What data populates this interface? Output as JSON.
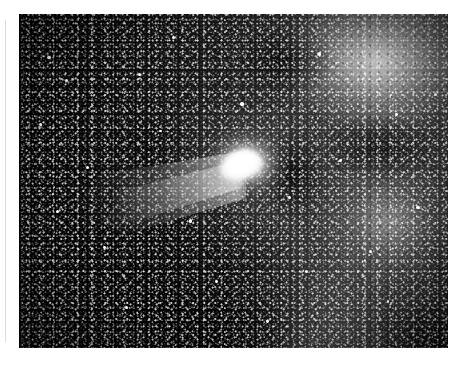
{
  "document": {
    "type": "astronomical-photograph",
    "subject": "comet",
    "medium": "black-and-white film plate",
    "caption": "",
    "background_color": "#ffffff"
  },
  "photo": {
    "name": "comet-photograph",
    "alt_text": "Black and white astronomical photograph of a bright comet with a fan-shaped dust tail set against a dense, grainy star field with diffuse nebulosity",
    "frame": {
      "x": 19,
      "y": 14,
      "width": 429,
      "height": 334
    },
    "palette": {
      "sky_dark": "#000000",
      "sky_mid": "#262626",
      "sky_light": "#3a3a3a",
      "nebulosity": "#d7d7d7",
      "star_white": "#ffffff",
      "comet_core": "#ffffff",
      "margin": "#ffffff",
      "scan_line": "#dcdcdc"
    },
    "features": [
      {
        "name": "comet-nucleus",
        "label": "Comet nucleus and inner coma",
        "position": {
          "x": 222,
          "y": 151
        },
        "brightness": "saturated white",
        "shape": "elongated teardrop"
      },
      {
        "name": "comet-tail",
        "label": "Fan-shaped dust tail",
        "direction": "down and to the left (southwest)",
        "extent_px": 175,
        "brightness": "bright diffuse, fading outward"
      },
      {
        "name": "nebulosity-upper-right",
        "label": "Diffuse bright nebulosity, upper right",
        "position": {
          "x": 380,
          "y": 55
        },
        "brightness": "bright mottled gray"
      },
      {
        "name": "nebulosity-lower-right",
        "label": "Rounded brighter patch, lower right",
        "position": {
          "x": 390,
          "y": 220
        },
        "brightness": "medium gray"
      },
      {
        "name": "dark-lane",
        "label": "Dark lane immediately right of the comet",
        "position": {
          "x": 290,
          "y": 205
        },
        "brightness": "near black"
      },
      {
        "name": "dark-region-left",
        "label": "Dark sparse region along the left edge",
        "position": {
          "x": 60,
          "y": 200
        },
        "brightness": "black with sparse stars"
      },
      {
        "name": "dark-region-bottom",
        "label": "Dark falloff along the bottom edge",
        "position": {
          "x": 200,
          "y": 330
        },
        "brightness": "black"
      }
    ],
    "bright_stars": [
      {
        "x": 0.07,
        "y": 0.13,
        "r": 1.9
      },
      {
        "x": 0.11,
        "y": 0.2,
        "r": 1.6
      },
      {
        "x": 0.05,
        "y": 0.33,
        "r": 1.5
      },
      {
        "x": 0.16,
        "y": 0.46,
        "r": 1.7
      },
      {
        "x": 0.09,
        "y": 0.59,
        "r": 1.5
      },
      {
        "x": 0.2,
        "y": 0.7,
        "r": 1.4
      },
      {
        "x": 0.28,
        "y": 0.18,
        "r": 1.6
      },
      {
        "x": 0.33,
        "y": 0.35,
        "r": 1.4
      },
      {
        "x": 0.25,
        "y": 0.88,
        "r": 1.5
      },
      {
        "x": 0.4,
        "y": 0.62,
        "r": 1.6
      },
      {
        "x": 0.46,
        "y": 0.8,
        "r": 1.5
      },
      {
        "x": 0.52,
        "y": 0.27,
        "r": 1.7
      },
      {
        "x": 0.58,
        "y": 0.92,
        "r": 1.4
      },
      {
        "x": 0.63,
        "y": 0.55,
        "r": 1.5
      },
      {
        "x": 0.7,
        "y": 0.12,
        "r": 1.6
      },
      {
        "x": 0.75,
        "y": 0.44,
        "r": 1.5
      },
      {
        "x": 0.82,
        "y": 0.71,
        "r": 1.6
      },
      {
        "x": 0.88,
        "y": 0.3,
        "r": 1.4
      },
      {
        "x": 0.93,
        "y": 0.58,
        "r": 1.7
      },
      {
        "x": 0.97,
        "y": 0.24,
        "r": 1.5
      },
      {
        "x": 0.86,
        "y": 0.86,
        "r": 1.4
      },
      {
        "x": 0.67,
        "y": 0.77,
        "r": 1.5
      },
      {
        "x": 0.36,
        "y": 0.07,
        "r": 1.5
      },
      {
        "x": 0.49,
        "y": 0.48,
        "r": 1.3
      }
    ]
  }
}
